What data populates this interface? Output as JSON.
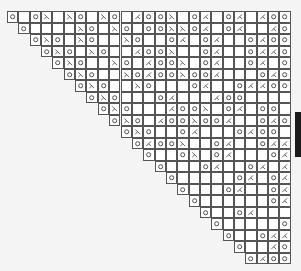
{
  "chart": {
    "columns": 25,
    "rows_count": 22,
    "legend": {
      "o": "yarn-over-icon",
      "k": "ssk-decrease-icon",
      "/": "k2tog-decrease-icon",
      ".": "knit-blank-cell"
    },
    "colors": {
      "grid": "#555555",
      "cell": "#ffffff",
      "symbol": "#444444",
      "background": "#f4f4f4"
    },
    "rows": [
      "o.ok.ko.ko./ook.o/.o/./oo",
      " o....ko.kolookko/.o/../oo",
      "  oko.ko..ko..o/.o/..o/oo",
      "   oko.ko../ook..o/..o//oo",
      "    oko..ko./ook.o/..o/.oo",
      "     oko..ko/ookoo/...o/oo",
      "      oko..kol..o/..o//oo",
      "       oko...o/.../oo",
      "        oko.../ook.o/.oo",
      "         oko./ookoo/..o/oo",
      "          oko..o/...o/oo",
      "           o/ook..o/..o//oo",
      "            o..ok.o/...o/oo",
      "             o...o/..o/./oo",
      "              o.....o/.o/oo",
      "               o...o/..o//oo",
      "                o......o/.oo",
      "                 o..o/..../oo",
      "                  o.....o/oo",
      "                   o..o//oo",
      "                    o../oo",
      "                     o/oo"
    ]
  }
}
